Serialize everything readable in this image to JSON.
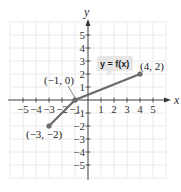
{
  "chart_data": {
    "type": "line",
    "title": "",
    "xlabel": "x",
    "ylabel": "y",
    "xlim": [
      -6,
      6
    ],
    "ylim": [
      -6,
      6
    ],
    "grid": true,
    "x_ticks": [
      -5,
      -4,
      -3,
      -2,
      -1,
      1,
      2,
      3,
      4,
      5
    ],
    "y_ticks": [
      -5,
      -4,
      -3,
      -2,
      -1,
      1,
      2,
      3,
      4,
      5
    ],
    "x_tick_labels": [
      "−5",
      "−4",
      "−3",
      "−2",
      "−1",
      "1",
      "2",
      "3",
      "4",
      "5"
    ],
    "y_tick_labels": [
      "−5",
      "−4",
      "−3",
      "−2",
      "−1",
      "1",
      "2",
      "3",
      "4",
      "5"
    ],
    "series": [
      {
        "name": "y = f(x)",
        "points": [
          [
            -3,
            -2
          ],
          [
            -1,
            0
          ],
          [
            4,
            2
          ]
        ],
        "color": "#6b6b6b"
      }
    ],
    "annotations": [
      {
        "text": "(−3, −2)",
        "x": -3,
        "y": -2
      },
      {
        "text": "(−1, 0)",
        "x": -1,
        "y": 0
      },
      {
        "text": "(4, 2)",
        "x": 4,
        "y": 2
      },
      {
        "text": "y = f(x)",
        "type": "callout"
      }
    ]
  },
  "labels": {
    "x_axis": "x",
    "y_axis": "y",
    "function": "y = f(x)",
    "p1": "(−3, −2)",
    "p2": "(−1, 0)",
    "p3": "(4, 2)"
  },
  "colors": {
    "grid": "#e4e4e4",
    "axis": "#333333",
    "line": "#6b6b6b",
    "callout_bg": "#e6e6e6"
  }
}
